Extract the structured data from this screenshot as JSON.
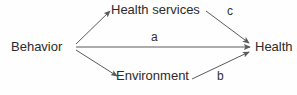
{
  "diagram": {
    "type": "path-diagram",
    "background_color": "#fefefe",
    "line_color": "#5a5a5a",
    "text_color": "#2b2b2b",
    "nodes": [
      {
        "id": "behavior",
        "label": "Behavior"
      },
      {
        "id": "health-services",
        "label": "Health services"
      },
      {
        "id": "environment",
        "label": "Environment"
      },
      {
        "id": "health",
        "label": "Health"
      }
    ],
    "edges": [
      {
        "id": "behavior-to-health-services",
        "from": "behavior",
        "to": "health-services",
        "label": ""
      },
      {
        "id": "behavior-to-health",
        "from": "behavior",
        "to": "health",
        "label": "a"
      },
      {
        "id": "behavior-to-environment",
        "from": "behavior",
        "to": "environment",
        "label": ""
      },
      {
        "id": "environment-to-health",
        "from": "environment",
        "to": "health",
        "label": "b"
      },
      {
        "id": "health-services-to-health",
        "from": "health-services",
        "to": "health",
        "label": "c"
      }
    ],
    "path_labels": {
      "a": "a",
      "b": "b",
      "c": "c"
    }
  }
}
